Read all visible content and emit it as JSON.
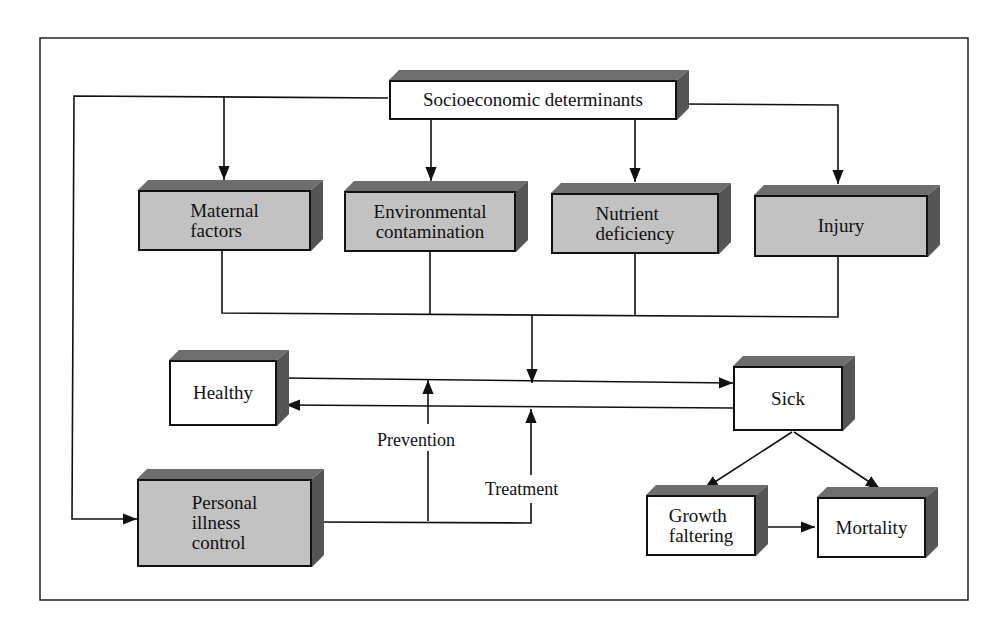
{
  "diagram": {
    "nodes": {
      "socioeconomic": {
        "label": "Socioeconomic determinants",
        "style": "white"
      },
      "maternal": {
        "label": "Maternal\nfactors",
        "style": "gray"
      },
      "environmental": {
        "label": "Environmental\ncontamination",
        "style": "gray"
      },
      "nutrient": {
        "label": "Nutrient\ndeficiency",
        "style": "gray"
      },
      "injury": {
        "label": "Injury",
        "style": "gray"
      },
      "healthy": {
        "label": "Healthy",
        "style": "white"
      },
      "sick": {
        "label": "Sick",
        "style": "white"
      },
      "personal": {
        "label": "Personal\nillness\ncontrol",
        "style": "gray"
      },
      "growth": {
        "label": "Growth\nfaltering",
        "style": "white"
      },
      "mortality": {
        "label": "Mortality",
        "style": "white"
      }
    },
    "edge_labels": {
      "prevention": "Prevention",
      "treatment": "Treatment"
    },
    "edges": [
      {
        "from": "socioeconomic",
        "to": "maternal"
      },
      {
        "from": "socioeconomic",
        "to": "environmental"
      },
      {
        "from": "socioeconomic",
        "to": "nutrient"
      },
      {
        "from": "socioeconomic",
        "to": "injury"
      },
      {
        "from": "socioeconomic",
        "to": "personal"
      },
      {
        "from": "maternal",
        "to": "healthy-sick-transition"
      },
      {
        "from": "environmental",
        "to": "healthy-sick-transition"
      },
      {
        "from": "nutrient",
        "to": "healthy-sick-transition"
      },
      {
        "from": "injury",
        "to": "healthy-sick-transition"
      },
      {
        "from": "healthy",
        "to": "sick"
      },
      {
        "from": "sick",
        "to": "healthy"
      },
      {
        "from": "personal",
        "to": "healthy-sick-transition",
        "label": "Prevention"
      },
      {
        "from": "personal",
        "to": "sick-healthy-transition",
        "label": "Treatment"
      },
      {
        "from": "sick",
        "to": "growth"
      },
      {
        "from": "sick",
        "to": "mortality"
      },
      {
        "from": "growth",
        "to": "mortality"
      }
    ],
    "colors": {
      "box_gray": "#c2c2c2",
      "line": "#111111",
      "shadow": "#6e6e6e"
    }
  }
}
